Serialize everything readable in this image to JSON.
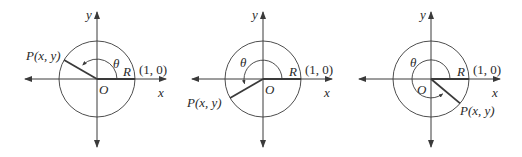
{
  "colors": {
    "line": "#3a3a3a",
    "text": "#2a2a2a",
    "background": "#ffffff"
  },
  "figures": [
    {
      "id": "quadrant-II",
      "origin_label": "O",
      "x_axis_label": "x",
      "y_axis_label": "y",
      "angle_label": "θ",
      "radius_label": "R",
      "unit_point_label": "(1, 0)",
      "point_label": "P(x, y)",
      "point_angle_deg": 150
    },
    {
      "id": "quadrant-III",
      "origin_label": "O",
      "x_axis_label": "x",
      "y_axis_label": "y",
      "angle_label": "θ",
      "radius_label": "R",
      "unit_point_label": "(1, 0)",
      "point_label": "P(x, y)",
      "point_angle_deg": 210
    },
    {
      "id": "quadrant-IV",
      "origin_label": "O",
      "x_axis_label": "x",
      "y_axis_label": "y",
      "angle_label": "θ",
      "radius_label": "R",
      "unit_point_label": "(1, 0)",
      "point_label": "P(x, y)",
      "point_angle_deg": 320
    }
  ]
}
